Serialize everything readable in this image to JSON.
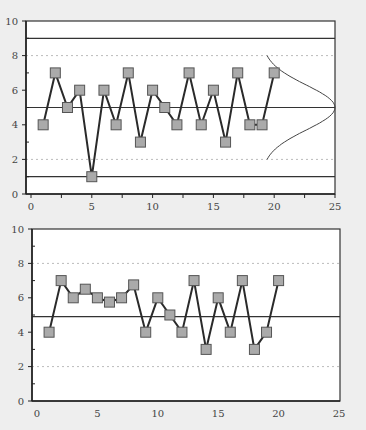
{
  "colors": {
    "background": "#eeeeee",
    "plot_bg": "#ffffff",
    "line": "#333333",
    "marker_fill": "#aaaaaa",
    "marker_stroke": "#555555",
    "dashed": "#bbbbbb"
  },
  "chart_data": [
    {
      "type": "line",
      "title": "Control chart with normal distribution",
      "xlabel": "",
      "ylabel": "",
      "xlim": [
        0,
        25
      ],
      "ylim": [
        0,
        10
      ],
      "xticks": [
        0,
        5,
        10,
        15,
        20,
        25
      ],
      "yticks": [
        0,
        2,
        4,
        6,
        8,
        10
      ],
      "x": [
        1,
        2,
        3,
        4,
        5,
        6,
        7,
        8,
        9,
        10,
        11,
        12,
        13,
        14,
        15,
        16,
        17,
        18,
        19,
        20
      ],
      "values": [
        4,
        7,
        5,
        6,
        1,
        6,
        4,
        7,
        3,
        6,
        5,
        4,
        7,
        4,
        6,
        3,
        7,
        4,
        4,
        7
      ],
      "reference_lines": {
        "solid": [
          9,
          5,
          1
        ],
        "dashed": [
          8,
          2
        ]
      },
      "normal_curve": {
        "mean": 5,
        "sigma": 1.3,
        "peak_x": 25,
        "base_x": 19
      },
      "grid": false,
      "legend": null
    },
    {
      "type": "line",
      "title": "Control chart",
      "xlabel": "",
      "ylabel": "",
      "xlim": [
        0,
        25
      ],
      "ylim": [
        0,
        10
      ],
      "xticks": [
        0,
        5,
        10,
        15,
        20,
        25
      ],
      "yticks": [
        0,
        2,
        4,
        6,
        8,
        10
      ],
      "x": [
        1,
        2,
        3,
        4,
        5,
        6,
        7,
        8,
        9,
        10,
        11,
        12,
        13,
        14,
        15,
        16,
        17,
        18,
        19,
        20
      ],
      "values": [
        4,
        7,
        6,
        6.5,
        6,
        5.75,
        6,
        6.75,
        4,
        6,
        5,
        4,
        7,
        3,
        6,
        4,
        7,
        3,
        4,
        7
      ],
      "reference_lines": {
        "solid": [
          4.9
        ],
        "dashed": [
          8,
          2
        ]
      },
      "grid": false,
      "legend": null
    }
  ]
}
